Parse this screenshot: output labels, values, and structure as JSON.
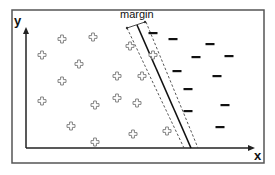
{
  "diagram": {
    "title": "",
    "type": "svm-margin",
    "labels": {
      "x_axis": "x",
      "y_axis": "y",
      "margin": "margin"
    },
    "frame": {
      "x": 12,
      "y": 10,
      "width": 252,
      "height": 153,
      "color": "#555555"
    },
    "axes": {
      "origin": [
        26,
        148
      ],
      "x_end": [
        255,
        148
      ],
      "y_end": [
        26,
        27
      ],
      "color": "#222222"
    },
    "hyperplane": {
      "solid": {
        "from": [
          137,
          25
        ],
        "to": [
          191,
          148
        ]
      },
      "dashed_left": {
        "from": [
          127,
          28
        ],
        "to": [
          184,
          148
        ]
      },
      "dashed_right": {
        "from": [
          146,
          22
        ],
        "to": [
          198,
          148
        ]
      }
    },
    "margin_indicator": {
      "from": [
        127,
        28
      ],
      "to": [
        145,
        22
      ]
    },
    "positive_class": {
      "symbol": "plus",
      "color": "#777777",
      "points": [
        [
          62,
          39
        ],
        [
          93,
          37
        ],
        [
          42,
          55
        ],
        [
          79,
          64
        ],
        [
          62,
          81
        ],
        [
          117,
          76
        ],
        [
          130,
          46
        ],
        [
          153,
          55
        ],
        [
          142,
          76
        ],
        [
          42,
          101
        ],
        [
          95,
          105
        ],
        [
          117,
          98
        ],
        [
          137,
          103
        ],
        [
          71,
          126
        ],
        [
          133,
          134
        ],
        [
          95,
          142
        ],
        [
          167,
          131
        ]
      ]
    },
    "negative_class": {
      "symbol": "minus",
      "color": "#111111",
      "points": [
        [
          153,
          33
        ],
        [
          173,
          39
        ],
        [
          210,
          44
        ],
        [
          196,
          57
        ],
        [
          229,
          56
        ],
        [
          177,
          71
        ],
        [
          217,
          76
        ],
        [
          188,
          89
        ],
        [
          225,
          105
        ],
        [
          188,
          111
        ],
        [
          220,
          127
        ]
      ]
    }
  }
}
